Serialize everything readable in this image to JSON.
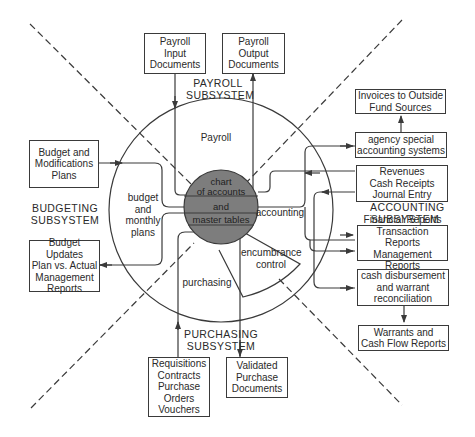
{
  "colors": {
    "line": "#3a3a3a",
    "core_fill": "#7d7d7d",
    "background": "#ffffff"
  },
  "core": {
    "lines": [
      "chart",
      "of accounts",
      "and",
      "master tables"
    ]
  },
  "sectors": {
    "payroll": "Payroll",
    "budget": [
      "budget",
      "and",
      "monthly",
      "plans"
    ],
    "accounting": "accounting",
    "purchasing": "purchasing",
    "encumbrance": [
      "encumbrance",
      "control"
    ]
  },
  "subsystems": {
    "payroll": [
      "PAYROLL",
      "SUBSYSTEM"
    ],
    "budgeting": [
      "BUDGETING",
      "SUBSYSTEM"
    ],
    "accounting": [
      "ACCOUNTING",
      "SUBSYSTEM"
    ],
    "purchasing": [
      "PURCHASING",
      "SUBSYSTEM"
    ]
  },
  "boxes": {
    "payroll_input": [
      "Payroll",
      "Input",
      "Documents"
    ],
    "payroll_output": [
      "Payroll",
      "Output",
      "Documents"
    ],
    "budget_mod": [
      "Budget and",
      "Modifications",
      "Plans"
    ],
    "budget_updates": [
      "Budget Updates",
      "Plan vs. Actual",
      "Management",
      "Reports"
    ],
    "invoices": [
      "Invoices to Outside",
      "Fund Sources"
    ],
    "agency": [
      "agency special",
      "accounting systems"
    ],
    "revenues": [
      "Revenues",
      "Cash Receipts",
      "Journal Entry"
    ],
    "financial": [
      "Financial Reports",
      "Transaction Reports",
      "Management Reports"
    ],
    "cash_disb": [
      "cash disbursement",
      "and warrant",
      "reconciliation"
    ],
    "warrants": [
      "Warrants and",
      "Cash Flow Reports"
    ],
    "requisitions": [
      "Requisitions",
      "Contracts",
      "Purchase",
      "Orders",
      "Vouchers"
    ],
    "validated": [
      "Validated",
      "Purchase",
      "Documents"
    ]
  }
}
